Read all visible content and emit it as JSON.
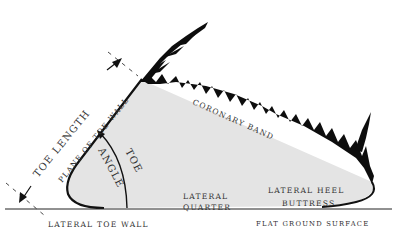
{
  "diagram": {
    "colors": {
      "hoof_fill": "#e4e4e4",
      "outline": "#111111",
      "hair": "#0d0d0d",
      "label": "#333333",
      "background": "#ffffff"
    },
    "labels": {
      "toe_length": "TOE LENGTH",
      "plane_of_toe_wall": "PLANE OF TOE WALL",
      "toe": "TOE",
      "angle": "ANGLE",
      "coronary_band": "CORONARY BAND",
      "lateral_quarter_1": "LATERAL",
      "lateral_quarter_2": "QUARTER",
      "lateral_heel_buttress_1": "LATERAL HEEL",
      "lateral_heel_buttress_2": "BUTTRESS",
      "lateral_toe_wall": "LATERAL TOE WALL",
      "flat_ground_surface": "FLAT GROUND SURFACE"
    }
  }
}
